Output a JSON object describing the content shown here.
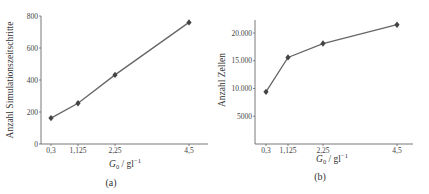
{
  "chart_data": [
    {
      "type": "line",
      "panel_label": "(a)",
      "title": "",
      "xlabel": "G0 / gl^-1",
      "ylabel": "Anzahl Simulationszeitschritte",
      "x": [
        0.3,
        1.125,
        2.25,
        4.5
      ],
      "x_tick_labels": [
        "0,3",
        "1,125",
        "2,25",
        "4,5"
      ],
      "values": [
        162,
        255,
        432,
        760
      ],
      "ylim": [
        0,
        800
      ],
      "y_ticks": [
        0,
        200,
        400,
        600,
        800
      ],
      "y_tick_labels": [
        "0",
        "200",
        "400",
        "600",
        "800"
      ],
      "marker": "diamond",
      "grid": false
    },
    {
      "type": "line",
      "panel_label": "(b)",
      "title": "",
      "xlabel": "G0 / gl^-1",
      "ylabel": "Anzahl Zellen",
      "x": [
        0.3,
        1.125,
        2.25,
        4.5
      ],
      "x_tick_labels": [
        "0,3",
        "1,125",
        "2,25",
        "4,5"
      ],
      "values": [
        9400,
        15600,
        18100,
        21500
      ],
      "ylim": [
        0,
        22000
      ],
      "y_ticks": [
        5000,
        10000,
        15000,
        20000
      ],
      "y_tick_labels": [
        "5000",
        "10.000",
        "15.000",
        "20.000"
      ],
      "marker": "diamond",
      "grid": false
    }
  ],
  "labels": {
    "a": {
      "ylabel": "Anzahl Simulationszeitschritte",
      "xlabel_main": "G",
      "xlabel_sub": "0",
      "xlabel_unit": " / gl",
      "xlabel_sup": "−1",
      "caption": "(a)"
    },
    "b": {
      "ylabel": "Anzahl Zellen",
      "xlabel_main": "G",
      "xlabel_sub": "0",
      "xlabel_unit": " / gl",
      "xlabel_sup": "−1",
      "caption": "(b)"
    }
  }
}
